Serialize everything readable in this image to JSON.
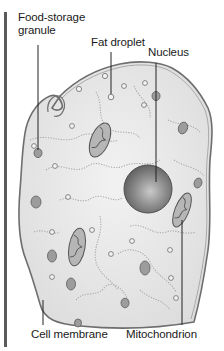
{
  "diagram": {
    "labels": {
      "food_storage_line1": "Food-storage",
      "food_storage_line2": "granule",
      "fat_droplet": "Fat droplet",
      "nucleus": "Nucleus",
      "cell_membrane": "Cell membrane",
      "mitochondrion": "Mitochondrion"
    },
    "colors": {
      "cytoplasm": "#e6e6e6",
      "membrane": "#6e6e6e",
      "nucleus": "#7a7a7a",
      "organelle": "#9a9a9a",
      "leader_line": "#222222",
      "side_bar": "#5a5a5a"
    }
  }
}
